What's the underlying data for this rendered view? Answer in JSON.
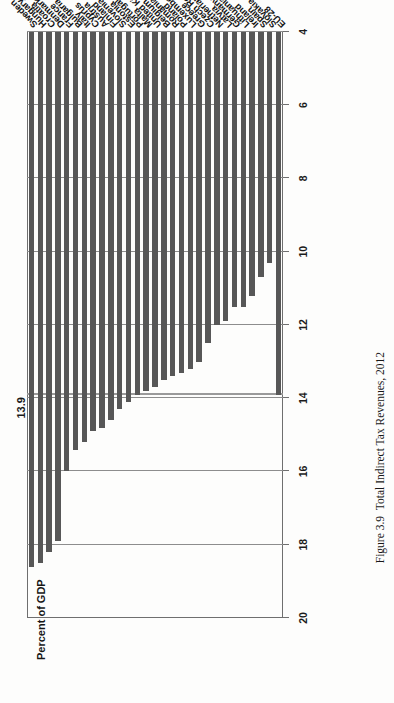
{
  "figure": {
    "caption_label": "Figure 3.9",
    "caption_title": "Total Indirect Tax Revenues, 2012"
  },
  "axis": {
    "title": "Percent of GDP",
    "tick_labels": [
      "20",
      "18",
      "16",
      "14",
      "12",
      "10",
      "8",
      "6",
      "4"
    ]
  },
  "reference": {
    "label": "13.9",
    "value": 13.9
  },
  "colors": {
    "bar": "#575757",
    "gridline": "#8d8d8d",
    "axis": "#6f6f6f",
    "reference_line": "#9a9a9a",
    "text": "#1b1b1b"
  },
  "chart_data": {
    "type": "bar",
    "orientation": "horizontal",
    "title": "Total Indirect Tax Revenues, 2012",
    "xlabel": "Percent of GDP",
    "ylabel": "",
    "xlim": [
      4,
      20
    ],
    "xticks": [
      4,
      6,
      8,
      10,
      12,
      14,
      16,
      18,
      20
    ],
    "grid": true,
    "legend": null,
    "reference_line": {
      "value": 13.9,
      "label": "13.9",
      "name": "EU-28 average"
    },
    "categories": [
      "Sweden",
      "Hungary",
      "Croatia",
      "Denmark",
      "France",
      "Bulgaria",
      "Italy",
      "Cyprus",
      "Austria",
      "Finland",
      "Slovenia",
      "Estonia",
      "Portugal",
      "Malta",
      "United Kingdom",
      "Belgium",
      "Romania",
      "Poland",
      "Luxembourg",
      "Greece",
      "Czech Republic",
      "Netherlands",
      "Latvia",
      "Germany",
      "Lithuania",
      "Ireland",
      "Spain",
      "Slovakia",
      "EU-28"
    ],
    "values": [
      18.6,
      18.5,
      18.2,
      17.9,
      16.0,
      15.4,
      15.2,
      14.9,
      14.8,
      14.6,
      14.3,
      14.1,
      13.9,
      13.8,
      13.7,
      13.5,
      13.4,
      13.3,
      13.2,
      13.0,
      12.5,
      12.0,
      11.9,
      11.5,
      11.5,
      11.2,
      10.7,
      10.3,
      13.9
    ],
    "value_labels_shown": [
      "13.9"
    ],
    "units": "percent of GDP",
    "source_year": 2012
  }
}
